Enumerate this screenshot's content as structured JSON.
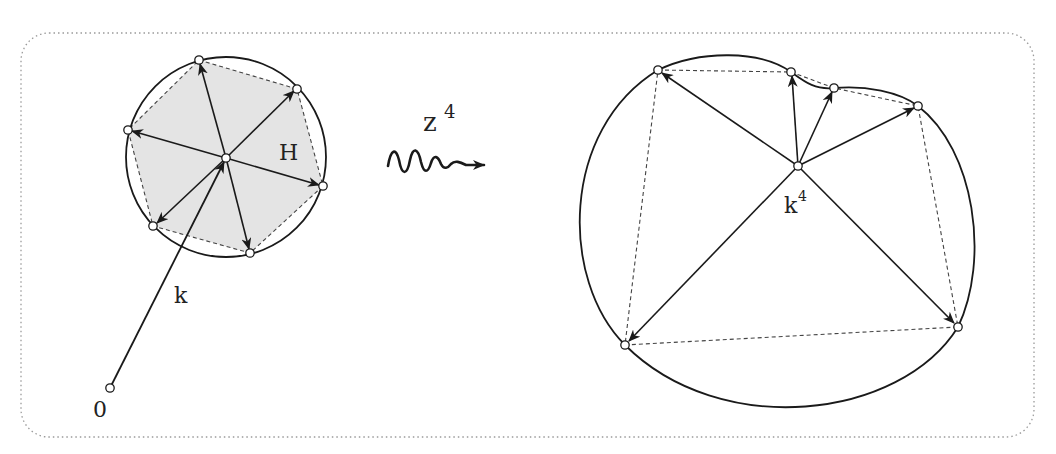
{
  "figure": {
    "frame": {
      "x": 21,
      "y": 33,
      "width": 1013,
      "height": 404,
      "radius": 28,
      "style": "dotted",
      "color": "#9a9a9a"
    },
    "colors": {
      "stroke": "#1a1a1a",
      "fill_region": "#e4e4e4",
      "dashed": "#444444",
      "node_fill": "#ffffff"
    },
    "left": {
      "circle": {
        "cx": 226,
        "cy": 157,
        "r": 100
      },
      "center": {
        "x": 226,
        "y": 158
      },
      "origin": {
        "x": 110,
        "y": 388
      },
      "vertices": [
        {
          "x": 199,
          "y": 60
        },
        {
          "x": 297,
          "y": 89
        },
        {
          "x": 323,
          "y": 186
        },
        {
          "x": 250,
          "y": 253
        },
        {
          "x": 153,
          "y": 226
        },
        {
          "x": 128,
          "y": 130
        }
      ],
      "labels": {
        "region": "H",
        "vector": "k",
        "origin": "0"
      }
    },
    "map_arrow": {
      "label": "z",
      "exponent": "4"
    },
    "right": {
      "center": {
        "x": 798,
        "y": 166
      },
      "vertices": [
        {
          "x": 658,
          "y": 70
        },
        {
          "x": 791,
          "y": 72
        },
        {
          "x": 834,
          "y": 88
        },
        {
          "x": 918,
          "y": 106
        },
        {
          "x": 958,
          "y": 327
        },
        {
          "x": 625,
          "y": 345
        }
      ],
      "labels": {
        "center": "k",
        "center_exponent": "4"
      }
    }
  }
}
